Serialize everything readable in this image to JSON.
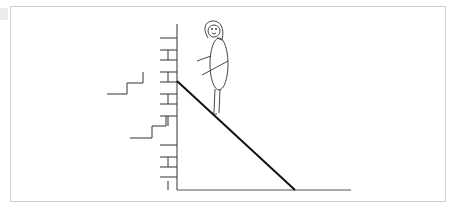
{
  "figure": {
    "caption": "",
    "elements": {
      "wall": "brick-wall",
      "ramp": "inclined-plane",
      "ground": "ground-line",
      "person": "girl-figure",
      "steps": [
        "step-shape-upper",
        "step-shape-lower"
      ]
    }
  },
  "colors": {
    "line": "#333333",
    "ramp": "#111111",
    "border": "#cfcfcf"
  }
}
